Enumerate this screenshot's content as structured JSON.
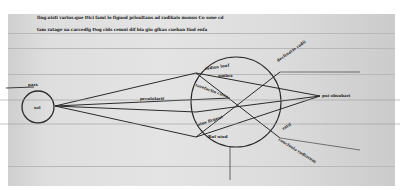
{
  "manuscript": {
    "header_lines": [
      "fing.uisti varius.que Dici fami lo figuod prloultans ad radikais monus Co sone cd",
      "tam ratage ua carcedfg Dog cids cemni dif bia giu gfkas cuehan tiud enfa"
    ],
    "labels": {
      "sun_circle": "sol",
      "sun_tag": "pars",
      "center_ray": "prculolarif",
      "upper_inner": "radius luuf",
      "upper_inner2": "umbra",
      "right_point": "pui obsubari",
      "left_inner": "rarefactio ciraa",
      "lower_inner": "aius Rrgent",
      "lower_small": "Ruf uiud",
      "upper_right_block": "declinatio radii",
      "lower_right_block": "conclusio radiorum",
      "right_small": "ratif"
    },
    "colors": {
      "ink": "#2a2a2a",
      "parchment": "#e2e2e2",
      "ruling": "#b8b8b8"
    }
  }
}
